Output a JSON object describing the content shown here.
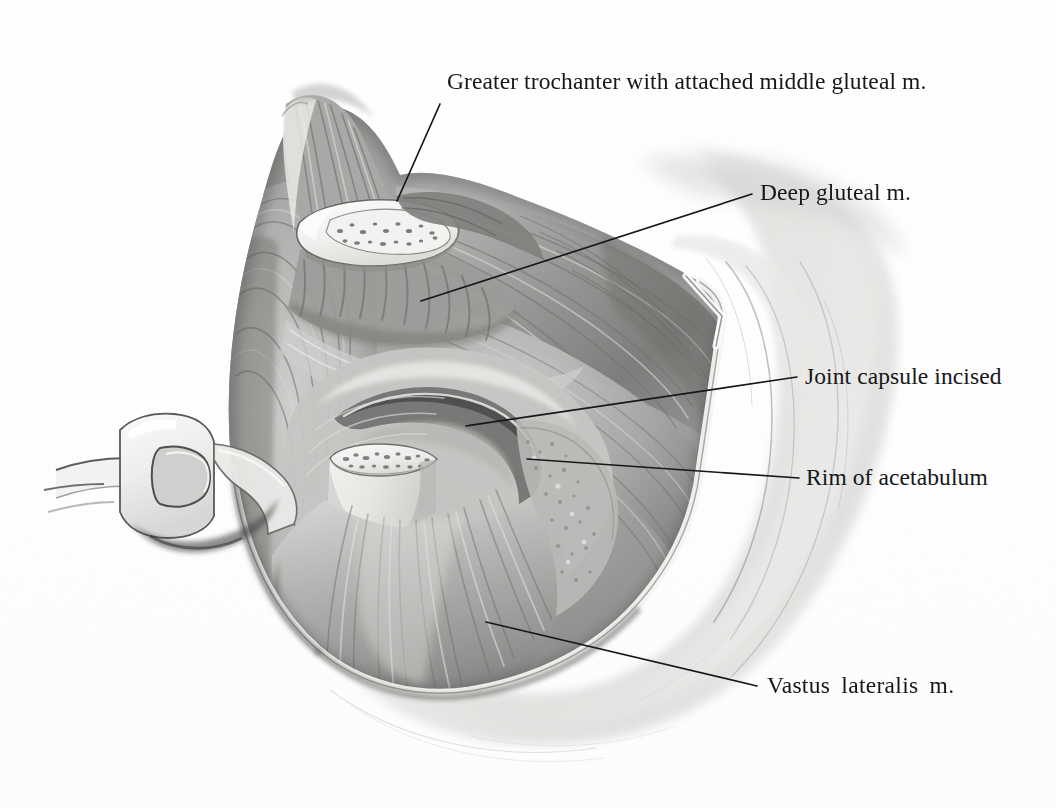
{
  "plate": {
    "type": "anatomical-illustration",
    "subject": "Lateral surgical exposure of the hip joint (trochanteric osteotomy approach)",
    "medium": "graphite pencil and wash, grayscale",
    "background_color": "#ffffff",
    "ink_color": "#17171a",
    "dimensions": {
      "width": 1056,
      "height": 808
    }
  },
  "labels": [
    {
      "id": "greater-trochanter",
      "text": "Greater trochanter with attached middle gluteal m.",
      "text_x": 447,
      "text_y": 88,
      "leader": {
        "x1": 440,
        "y1": 104,
        "x2": 397,
        "y2": 201
      }
    },
    {
      "id": "deep-gluteal",
      "text": "Deep gluteal m.",
      "text_x": 760,
      "text_y": 199,
      "leader": {
        "x1": 752,
        "y1": 194,
        "x2": 421,
        "y2": 301
      }
    },
    {
      "id": "joint-capsule",
      "text": "Joint capsule incised",
      "text_x": 805,
      "text_y": 383,
      "leader": {
        "x1": 797,
        "y1": 377,
        "x2": 466,
        "y2": 426
      }
    },
    {
      "id": "rim-of-acetabulum",
      "text": "Rim of acetabulum",
      "text_x": 806,
      "text_y": 484,
      "leader": {
        "x1": 799,
        "y1": 478,
        "x2": 527,
        "y2": 459
      }
    },
    {
      "id": "vastus-lateralis",
      "text": "Vastus  lateralis  m.",
      "text_x": 767,
      "text_y": 692,
      "leader": {
        "x1": 757,
        "y1": 686,
        "x2": 486,
        "y2": 622
      }
    }
  ],
  "structures": [
    {
      "id": "greater-trochanter-cut-surface",
      "note": "pale oval of osteotomized cancellous bone with trabecular speckling"
    },
    {
      "id": "middle-gluteal-muscle",
      "note": "striated muscle attached above the trochanter"
    },
    {
      "id": "deep-gluteal-muscle",
      "note": "broad fan of fibres filling the upper right of the wound"
    },
    {
      "id": "joint-capsule-flap",
      "note": "crescentic incised capsule retracted as a flap"
    },
    {
      "id": "femoral-neck-stump",
      "note": "second cut bone surface with trabecular speckling"
    },
    {
      "id": "acetabular-rim",
      "note": "roughened bony margin right of the capsule"
    },
    {
      "id": "vastus-lateralis-muscle",
      "note": "fibres fanning downward from the trochanteric region"
    },
    {
      "id": "surgical-retractor",
      "note": "slotted metal blade at the left wound margin"
    },
    {
      "id": "skin-flap",
      "note": "pale retracted skin and fascia forming the wound border"
    },
    {
      "id": "wound-outline",
      "note": "rounded triangular exposure with an angled corner at the right"
    }
  ]
}
